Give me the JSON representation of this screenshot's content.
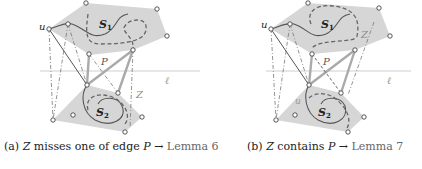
{
  "figures": [
    {
      "id": "a",
      "caption": {
        "prefix": "(a)",
        "var": "Z",
        "text": "misses one of edge",
        "var2": "P",
        "arrow": "→",
        "ref": "Lemma 6"
      },
      "labels": {
        "u": "u",
        "S1": "S",
        "S1_sub": "1",
        "S2": "S",
        "S2_sub": "2",
        "P": "P",
        "Z": "Z",
        "ell": "ℓ"
      }
    },
    {
      "id": "b",
      "caption": {
        "prefix": "(b)",
        "var": "Z",
        "text": "contains",
        "var2": "P",
        "arrow": "→",
        "ref": "Lemma 7"
      },
      "labels": {
        "u": "u",
        "S1": "S",
        "S1_sub": "1",
        "S2": "S",
        "S2_sub": "2",
        "P": "P",
        "Z": "Z",
        "ell": "ℓ",
        "u2": "u"
      }
    }
  ],
  "colors": {
    "region_fill": "#d9d9d9",
    "stroke": "#555555",
    "ref_text": "#666666",
    "line_ell": "#cccccc"
  }
}
